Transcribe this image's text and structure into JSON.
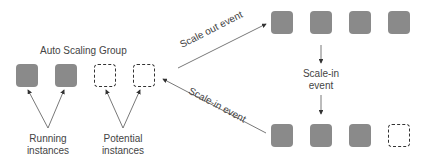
{
  "group_label": "Auto Scaling Group",
  "running_label": [
    "Running",
    "instances"
  ],
  "potential_label": [
    "Potential",
    "instances"
  ],
  "scale_out_label": "Scale out event",
  "scale_in_label": "Scale-in event",
  "scale_in_vertical_label": [
    "Scale-in",
    "event"
  ],
  "colors": {
    "running": "#8a8a8a",
    "outline": "#333333",
    "text": "#444444"
  },
  "rows": {
    "initial": [
      "running",
      "running",
      "potential",
      "potential"
    ],
    "after_scale_out": [
      "running",
      "running",
      "running",
      "running"
    ],
    "after_scale_in": [
      "running",
      "running",
      "running",
      "potential"
    ]
  }
}
